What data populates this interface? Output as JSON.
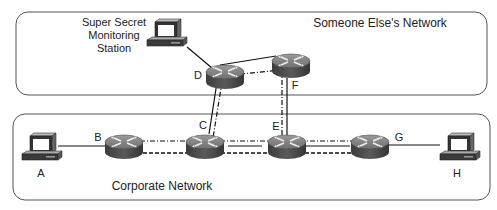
{
  "zones": {
    "external": {
      "label": "Someone Else's Network"
    },
    "corporate": {
      "label": "Corporate Network"
    }
  },
  "stations": {
    "monitor": {
      "line1": "Super Secret",
      "line2": "Monitoring",
      "line3": "Station"
    },
    "A": {
      "label": "A"
    },
    "H": {
      "label": "H"
    }
  },
  "routers": {
    "B": {
      "label": "B"
    },
    "C": {
      "label": "C"
    },
    "D": {
      "label": "D"
    },
    "E": {
      "label": "E"
    },
    "F": {
      "label": "F"
    },
    "G": {
      "label": "G"
    }
  },
  "links": [
    {
      "from": "Monitor",
      "to": "D",
      "style": "solid"
    },
    {
      "from": "D",
      "to": "F",
      "style": "solid"
    },
    {
      "from": "D",
      "to": "F",
      "style": "dash-dot"
    },
    {
      "from": "D",
      "to": "C",
      "style": "solid"
    },
    {
      "from": "D",
      "to": "C",
      "style": "dash-dot"
    },
    {
      "from": "F",
      "to": "E",
      "style": "solid"
    },
    {
      "from": "F",
      "to": "E",
      "style": "dash-dot"
    },
    {
      "from": "A",
      "to": "B",
      "style": "solid"
    },
    {
      "from": "B",
      "to": "G",
      "style": "dash-dot"
    },
    {
      "from": "B",
      "to": "G",
      "style": "dashed"
    },
    {
      "from": "G",
      "to": "H",
      "style": "solid"
    }
  ]
}
